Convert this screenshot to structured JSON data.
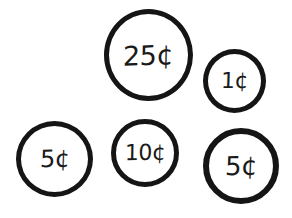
{
  "figure": {
    "type": "coin-illustration",
    "background_color": "#ffffff",
    "ink_color": "#151515",
    "coins": [
      {
        "id": "quarter",
        "name": "quarter",
        "label": "25¢",
        "value_cents": 25,
        "position": "top-center",
        "size": "largest"
      },
      {
        "id": "penny",
        "name": "penny",
        "label": "1¢",
        "value_cents": 1,
        "position": "top-right",
        "size": "smallest"
      },
      {
        "id": "nickel-left",
        "name": "nickel",
        "label": "5¢",
        "value_cents": 5,
        "position": "bottom-left",
        "size": "medium-large"
      },
      {
        "id": "dime",
        "name": "dime",
        "label": "10¢",
        "value_cents": 10,
        "position": "bottom-center",
        "size": "medium"
      },
      {
        "id": "nickel-right",
        "name": "nickel",
        "label": "5¢",
        "value_cents": 5,
        "position": "bottom-right",
        "size": "medium-large"
      }
    ]
  }
}
